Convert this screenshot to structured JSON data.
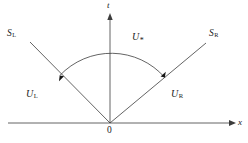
{
  "figure": {
    "type": "riemann-problem-wave-structure",
    "background_color": "#ffffff",
    "line_color": "#3c3c3c",
    "text_color": "#1a1a1a"
  },
  "axes": {
    "t_label": "t",
    "x_label": "x",
    "origin_label": "0"
  },
  "waves": {
    "left": {
      "base": "S",
      "subscript": "L"
    },
    "right": {
      "base": "S",
      "subscript": "R"
    }
  },
  "states": {
    "left": {
      "base": "U",
      "subscript": "L"
    },
    "star": {
      "base": "U",
      "subscript": "*"
    },
    "right": {
      "base": "U",
      "subscript": "R"
    }
  },
  "geometry": {
    "origin_x": 110,
    "origin_y": 123,
    "t_axis_top_y": 14,
    "x_axis_right_x": 232,
    "x_axis_left_x": 8,
    "left_ray_end_x": 30,
    "left_ray_end_y": 42,
    "right_ray_end_x": 206,
    "right_ray_end_y": 43,
    "arc_radius": 71
  }
}
